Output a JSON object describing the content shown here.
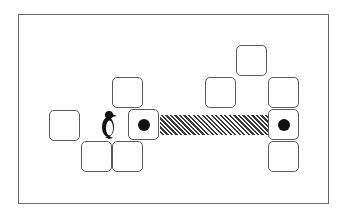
{
  "diagram": {
    "colors": {
      "frame": "#6a6a6a",
      "tile_border": "#5a5a5a",
      "dot": "#111111",
      "hatch": "#3a3a3a",
      "background": "#ffffff"
    },
    "tiles": [
      {
        "id": "left-single",
        "x": 49,
        "y": 110,
        "has_dot": false
      },
      {
        "id": "left-upper",
        "x": 112,
        "y": 77,
        "has_dot": false
      },
      {
        "id": "left-dot",
        "x": 128,
        "y": 109,
        "has_dot": true
      },
      {
        "id": "left-bottom-1",
        "x": 81,
        "y": 141,
        "has_dot": false
      },
      {
        "id": "left-bottom-2",
        "x": 112,
        "y": 141,
        "has_dot": false
      },
      {
        "id": "right-top",
        "x": 236,
        "y": 45,
        "has_dot": false
      },
      {
        "id": "right-mid-left",
        "x": 205,
        "y": 77,
        "has_dot": false
      },
      {
        "id": "right-col-1",
        "x": 268,
        "y": 77,
        "has_dot": false
      },
      {
        "id": "right-dot",
        "x": 268,
        "y": 109,
        "has_dot": true
      },
      {
        "id": "right-col-3",
        "x": 268,
        "y": 141,
        "has_dot": false
      }
    ],
    "bridge": {
      "from": "left-dot",
      "to": "right-dot",
      "pattern": "diagonal-hatch"
    },
    "agent": {
      "type": "penguin",
      "x": 100,
      "y": 110
    }
  }
}
